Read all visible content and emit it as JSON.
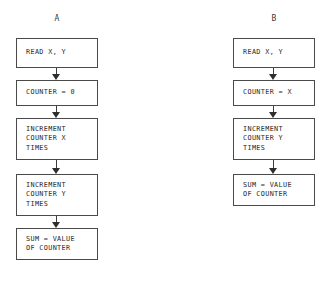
{
  "figure": {
    "background": "#ffffff",
    "line_color": "#4a4a4a",
    "text_color": "#1f1f1f",
    "columns": [
      {
        "label": "A",
        "nodes": [
          {
            "text": "READ X, Y",
            "size": "h1"
          },
          {
            "text": "COUNTER = 0",
            "size": "h2"
          },
          {
            "text": "INCREMENT\nCOUNTER X\nTIMES",
            "size": "h3"
          },
          {
            "text": "INCREMENT\nCOUNTER Y\nTIMES",
            "size": "h3"
          },
          {
            "text": "SUM = VALUE\nOF COUNTER",
            "size": "h4"
          }
        ],
        "connectors": [
          "gap12",
          "gap12",
          "gap14",
          "gap12"
        ]
      },
      {
        "label": "B",
        "nodes": [
          {
            "text": "READ X, Y",
            "size": "h1"
          },
          {
            "text": "COUNTER = X",
            "size": "h2"
          },
          {
            "text": "INCREMENT\nCOUNTER Y\nTIMES",
            "size": "h3"
          },
          {
            "text": "SUM = VALUE\nOF COUNTER",
            "size": "h4"
          }
        ],
        "connectors": [
          "gap12",
          "gap12",
          "gap14"
        ]
      }
    ],
    "caption": ""
  }
}
